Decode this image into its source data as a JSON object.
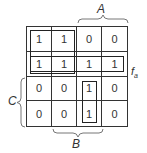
{
  "diagram": {
    "type": "karnaugh-map",
    "function_label": "f",
    "function_subscript": "a",
    "variables": {
      "A": "A",
      "B": "B",
      "C": "C"
    },
    "grid": [
      [
        "1",
        "1",
        "0",
        "0"
      ],
      [
        "1",
        "1",
        "1",
        "1"
      ],
      [
        "0",
        "0",
        "1",
        "0"
      ],
      [
        "0",
        "0",
        "1",
        "0"
      ]
    ],
    "groupings": [
      {
        "name": "top-left-quad",
        "rows": [
          0,
          1
        ],
        "cols": [
          0,
          1
        ]
      },
      {
        "name": "row-2-full",
        "rows": [
          1
        ],
        "cols": [
          0,
          1,
          2,
          3
        ]
      },
      {
        "name": "column-3-pair",
        "rows": [
          2,
          3
        ],
        "cols": [
          2
        ]
      }
    ],
    "braces": [
      {
        "label": "A",
        "side": "top",
        "spans_cols": [
          2,
          3
        ]
      },
      {
        "label": "B",
        "side": "bottom",
        "spans_cols": [
          1,
          2
        ]
      },
      {
        "label": "C",
        "side": "left",
        "spans_rows": [
          2,
          3
        ]
      }
    ]
  }
}
